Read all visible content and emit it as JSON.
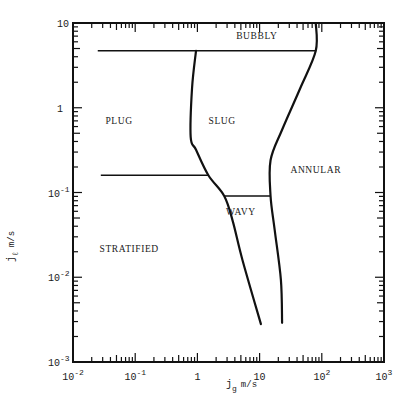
{
  "chart_data": {
    "type": "line",
    "title": "",
    "subtitle": "Two-phase flow regime map (horizontal flow)",
    "xlabel": "j_g m/s",
    "ylabel": "j_ℓ m/s",
    "xscale": "log",
    "yscale": "log",
    "xlim": [
      0.01,
      1000
    ],
    "ylim": [
      0.001,
      10
    ],
    "grid": false,
    "legend": null,
    "x_ticks": [
      {
        "value": 0.01,
        "base": "10",
        "exp": "-2"
      },
      {
        "value": 0.1,
        "base": "10",
        "exp": "-1"
      },
      {
        "value": 1,
        "base": "1",
        "exp": ""
      },
      {
        "value": 10,
        "base": "10",
        "exp": ""
      },
      {
        "value": 100,
        "base": "10",
        "exp": "2"
      },
      {
        "value": 1000,
        "base": "10",
        "exp": "3"
      }
    ],
    "y_ticks": [
      {
        "value": 10,
        "base": "10",
        "exp": ""
      },
      {
        "value": 1,
        "base": "1",
        "exp": ""
      },
      {
        "value": 0.1,
        "base": "10",
        "exp": "-1"
      },
      {
        "value": 0.01,
        "base": "10",
        "exp": "-2"
      },
      {
        "value": 0.001,
        "base": "10",
        "exp": "-3"
      }
    ],
    "regions": [
      {
        "name": "BUBBLY",
        "x": 9,
        "y": 6.5
      },
      {
        "name": "PLUG",
        "x": 0.055,
        "y": 0.65
      },
      {
        "name": "SLUG",
        "x": 2.5,
        "y": 0.65
      },
      {
        "name": "ANNULAR",
        "x": 80,
        "y": 0.17
      },
      {
        "name": "WAVY",
        "x": 5,
        "y": 0.055
      },
      {
        "name": "STRATIFIED",
        "x": 0.08,
        "y": 0.02
      }
    ],
    "boundaries": [
      {
        "name": "bubbly-lower",
        "points": [
          [
            0.025,
            4.7
          ],
          [
            80,
            4.7
          ]
        ]
      },
      {
        "name": "plug-stratified",
        "points": [
          [
            0.028,
            0.16
          ],
          [
            1.5,
            0.16
          ]
        ]
      },
      {
        "name": "wavy-upper",
        "points": [
          [
            2.7,
            0.091
          ],
          [
            15,
            0.091
          ]
        ]
      },
      {
        "name": "slug-left",
        "points": [
          [
            0.95,
            4.7
          ],
          [
            0.82,
            1.7
          ],
          [
            0.78,
            0.45
          ],
          [
            0.95,
            0.32
          ],
          [
            1.5,
            0.16
          ],
          [
            2.7,
            0.091
          ],
          [
            3.7,
            0.046
          ],
          [
            5.3,
            0.016
          ],
          [
            10.5,
            0.0028
          ]
        ]
      },
      {
        "name": "slug-annular-right",
        "points": [
          [
            80,
            10
          ],
          [
            80,
            4.7
          ],
          [
            45,
            1.7
          ],
          [
            23,
            0.55
          ],
          [
            15,
            0.24
          ],
          [
            15,
            0.091
          ],
          [
            17.5,
            0.036
          ],
          [
            22,
            0.0093
          ],
          [
            23,
            0.0029
          ]
        ]
      }
    ]
  },
  "axes": {
    "x_title_main": "j",
    "x_title_sub": "g",
    "x_title_unit": "m/s",
    "y_title_main": "j",
    "y_title_sub": "ℓ",
    "y_title_unit": "m/s"
  }
}
